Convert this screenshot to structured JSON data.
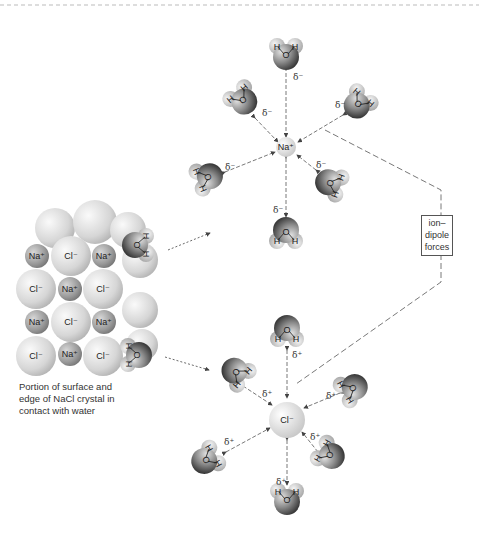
{
  "diagram": {
    "crystal": {
      "caption": "Portion of surface and edge of NaCl crystal in contact with water",
      "rows": [
        [
          "Na⁺",
          "Cl⁻",
          "Na⁺"
        ],
        [
          "Cl⁻",
          "Na⁺",
          "Cl⁻"
        ],
        [
          "Na⁺",
          "Cl⁻",
          "Na⁺"
        ],
        [
          "Cl⁻",
          "Na⁺",
          "Cl⁻"
        ]
      ]
    },
    "box_label": {
      "line1": "ion–",
      "line2": "dipole",
      "line3": "forces"
    },
    "cation": {
      "label": "Na⁺",
      "partial_charge_of_water": "δ⁻",
      "water_count": 6
    },
    "anion": {
      "label": "Cl⁻",
      "partial_charge_of_water": "δ⁺",
      "water_count": 6
    },
    "water": {
      "oxygen": "O",
      "hydrogen": "H"
    },
    "colors": {
      "cl_ion": "#dcdcdc",
      "na_ion": "#9a9a9a",
      "oxygen": "#6a6a6a",
      "hydrogen": "#c8c8c8",
      "lines": "#555555"
    }
  }
}
